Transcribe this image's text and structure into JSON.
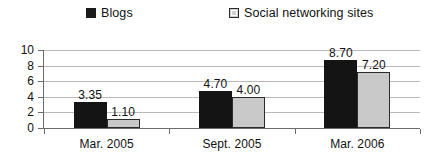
{
  "chart_data": {
    "type": "bar",
    "title": "",
    "xlabel": "",
    "ylabel": "",
    "categories": [
      "Mar. 2005",
      "Sept. 2005",
      "Mar. 2006"
    ],
    "series": [
      {
        "name": "Blogs",
        "values": [
          3.35,
          4.7,
          8.7
        ],
        "labels": [
          "3.35",
          "4.70",
          "8.70"
        ],
        "color": "#141414",
        "marker": "filled-square"
      },
      {
        "name": "Social networking sites",
        "values": [
          1.1,
          4.0,
          7.2
        ],
        "labels": [
          "1.10",
          "4.00",
          "7.20"
        ],
        "color": "#c9c9c9",
        "marker": "hollow-square"
      }
    ],
    "ylim": [
      0,
      10
    ],
    "yticks": [
      0,
      2,
      4,
      6,
      8,
      10
    ],
    "ytick_labels": [
      "0",
      "2",
      "4",
      "6",
      "8",
      "10"
    ],
    "grid": true,
    "legend_position": "top"
  },
  "legend": {
    "entries": [
      {
        "label": "Blogs"
      },
      {
        "label": "Social networking sites"
      }
    ]
  }
}
